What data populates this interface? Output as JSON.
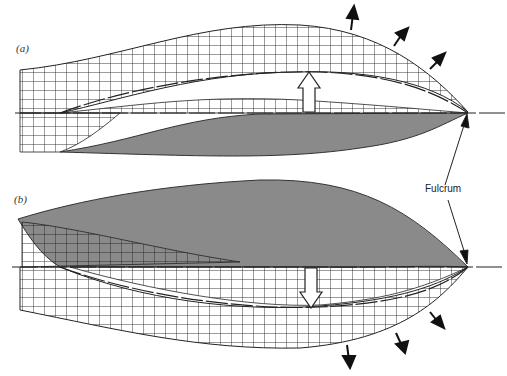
{
  "panels": [
    {
      "id": "a",
      "label": "(a)",
      "direction": "upward"
    },
    {
      "id": "b",
      "label": "(b)",
      "direction": "downward"
    }
  ],
  "annotations": {
    "fulcrum": "Fulcrum"
  },
  "colors": {
    "fill": "#8a8a8a",
    "line": "#222222",
    "background": "#ffffff"
  }
}
